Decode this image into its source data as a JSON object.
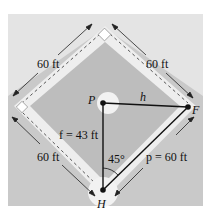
{
  "diagram": {
    "labels": {
      "top_left_side": "60 ft",
      "top_right_side": "60 ft",
      "bottom_left_side": "60 ft",
      "p_point": "P",
      "f_point": "F",
      "h_point": "H",
      "h_segment": "h",
      "f_segment": "f = 43 ft",
      "p_segment": "p = 60 ft",
      "angle": "45°"
    },
    "colors": {
      "outer_field": "#c9c9c9",
      "outer_light": "#e6e6e6",
      "infield": "#bdbdbd",
      "baseline_path": "#ededed",
      "line": "#111111"
    }
  }
}
